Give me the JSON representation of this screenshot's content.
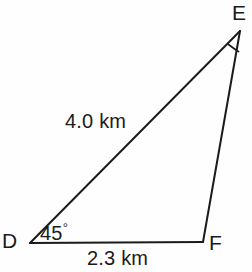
{
  "figure": {
    "type": "triangle-diagram",
    "stroke_color": "#1b1b1b",
    "background_color": "#fefefe",
    "vertices": {
      "D": {
        "label": "D",
        "x": 30,
        "y": 243
      },
      "E": {
        "label": "E",
        "x": 240,
        "y": 31
      },
      "F": {
        "label": "F",
        "x": 203,
        "y": 242
      }
    },
    "sides": {
      "DE": {
        "label": "4.0 km",
        "value": 4.0,
        "unit": "km"
      },
      "DF": {
        "label": "2.3 km",
        "value": 2.3,
        "unit": "km"
      },
      "EF": {
        "label": "",
        "value": null,
        "unit": "km"
      }
    },
    "angles": {
      "D": {
        "label": "45",
        "degree_symbol": "°",
        "value": 45,
        "marked": true
      },
      "E": {
        "label": "",
        "value": null,
        "marked": true
      },
      "F": {
        "label": "",
        "value": null,
        "marked": false
      }
    }
  }
}
